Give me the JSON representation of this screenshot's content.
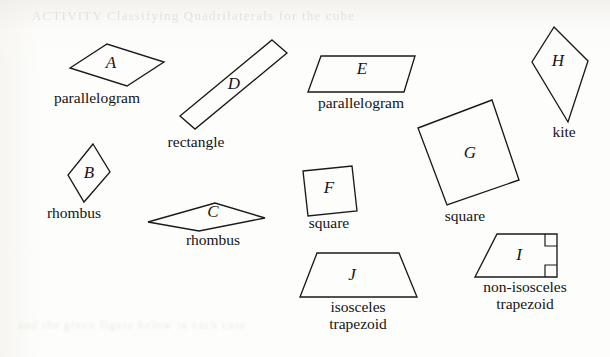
{
  "figure": {
    "background_color": "#fdfdfb",
    "stroke_color": "#1a1a1a",
    "bleed_through_line_1": "ACTIVITY  Classifying Quadrilaterals  for  the  cube",
    "bleed_through_line_2": "and  the  given  figure  below  in  each  case",
    "shapes": [
      {
        "id": "A",
        "letter": "A",
        "caption": "parallelogram",
        "kind": "parallelogram",
        "points": "70,68 107,44 164,62 127,86",
        "letter_pos": {
          "x": 111,
          "y": 64
        },
        "caption_pos": {
          "x": 97,
          "y": 90
        }
      },
      {
        "id": "D",
        "letter": "D",
        "caption": "rectangle",
        "kind": "rectangle",
        "points": "272,40 287,53 195,129 180,116",
        "letter_pos": {
          "x": 234,
          "y": 85
        },
        "caption_pos": {
          "x": 196,
          "y": 134
        }
      },
      {
        "id": "E",
        "letter": "E",
        "caption": "parallelogram",
        "kind": "parallelogram",
        "points": "321,56 415,56 404,92 308,92",
        "letter_pos": {
          "x": 362,
          "y": 70
        },
        "caption_pos": {
          "x": 361,
          "y": 95
        }
      },
      {
        "id": "H",
        "letter": "H",
        "caption": "kite",
        "kind": "kite",
        "points": "554,27 588,61 568,122 532,62",
        "letter_pos": {
          "x": 558,
          "y": 62
        },
        "caption_pos": {
          "x": 564,
          "y": 124
        }
      },
      {
        "id": "B",
        "letter": "B",
        "caption": "rhombus",
        "kind": "rhombus",
        "points": "93,144 110,172 84,202 68,175",
        "letter_pos": {
          "x": 89,
          "y": 174
        },
        "caption_pos": {
          "x": 74,
          "y": 205
        }
      },
      {
        "id": "C",
        "letter": "C",
        "caption": "rhombus",
        "kind": "rhombus",
        "points": "148,222 215,203 265,218 199,231",
        "letter_pos": {
          "x": 213,
          "y": 213
        },
        "caption_pos": {
          "x": 213,
          "y": 232
        }
      },
      {
        "id": "F",
        "letter": "F",
        "caption": "square",
        "kind": "square",
        "points": "303,171 352,166 357,211 308,216",
        "letter_pos": {
          "x": 329,
          "y": 189
        },
        "caption_pos": {
          "x": 329,
          "y": 215
        }
      },
      {
        "id": "G",
        "letter": "G",
        "caption": "square",
        "kind": "square",
        "points": "492,100 519,180 447,205 418,128",
        "letter_pos": {
          "x": 470,
          "y": 154
        },
        "caption_pos": {
          "x": 465,
          "y": 208
        }
      },
      {
        "id": "J",
        "letter": "J",
        "caption": "isosceles\ntrapezoid",
        "kind": "isosceles-trapezoid",
        "points": "317,253 399,253 417,297 300,297",
        "letter_pos": {
          "x": 352,
          "y": 276
        },
        "caption_pos": {
          "x": 358,
          "y": 299
        }
      },
      {
        "id": "I",
        "letter": "I",
        "caption": "non-isosceles\ntrapezoid",
        "kind": "right-trapezoid",
        "points": "497,234 557,234 557,277 475,277",
        "letter_pos": {
          "x": 519,
          "y": 256
        },
        "caption_pos": {
          "x": 525,
          "y": 279
        },
        "right_angle_marks": [
          "545,234 545,246 557,246",
          "545,277 545,265 557,265"
        ]
      }
    ]
  }
}
